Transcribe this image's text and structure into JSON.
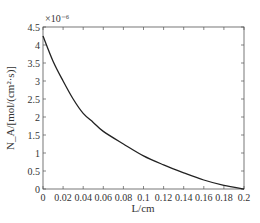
{
  "chart_data": {
    "type": "line",
    "title": "",
    "xlabel": "L/cm",
    "ylabel": "N_A/[mol/(cm²·s)]",
    "y_multiplier": "×10⁻⁶",
    "xlim": [
      0,
      0.2
    ],
    "ylim": [
      0,
      4.5
    ],
    "x_ticks": [
      "0",
      "0.02",
      "0.04",
      "0.06",
      "0.08",
      "0.1",
      "0.12",
      "0.14",
      "0.16",
      "0.18",
      "0.2"
    ],
    "y_ticks": [
      "0",
      "0.5",
      "1",
      "1.5",
      "2",
      "2.5",
      "3",
      "3.5",
      "4",
      "4.5"
    ],
    "grid": false,
    "series": [
      {
        "name": "N_A",
        "x": [
          0,
          0.01,
          0.02,
          0.03,
          0.04,
          0.05,
          0.06,
          0.08,
          0.1,
          0.12,
          0.14,
          0.16,
          0.18,
          0.2
        ],
        "values": [
          4.25,
          3.55,
          3.0,
          2.5,
          2.1,
          1.85,
          1.6,
          1.25,
          0.92,
          0.67,
          0.45,
          0.25,
          0.1,
          0.0
        ]
      }
    ]
  }
}
